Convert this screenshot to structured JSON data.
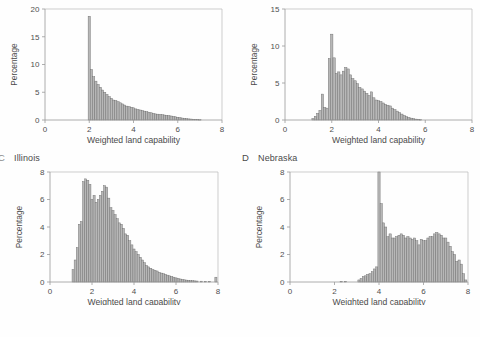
{
  "figure": {
    "caption_fragment": "",
    "shared_xlabel": "Weighted land capability",
    "shared_ylabel": "Percentage"
  },
  "panels": [
    {
      "letter": "",
      "name": "",
      "letter_clipped": true,
      "header_visible": false
    },
    {
      "letter": "",
      "name": "",
      "letter_clipped": true,
      "header_visible": false
    },
    {
      "letter": "C",
      "name": "Illinois",
      "letter_clipped": true,
      "header_visible": true
    },
    {
      "letter": "D",
      "name": "Nebraska",
      "letter_clipped": false,
      "header_visible": true
    }
  ],
  "chart_data": [
    {
      "type": "bar",
      "panel_letter": "",
      "panel_name": "",
      "title": "",
      "xlabel": "Weighted land capability",
      "ylabel": "Percentage",
      "xlim": [
        0,
        8
      ],
      "ylim": [
        0,
        20
      ],
      "xticks": [
        0,
        2,
        4,
        6,
        8
      ],
      "yticks": [
        0,
        5,
        10,
        15,
        20
      ],
      "grid": false,
      "bin_width": 0.1,
      "x": [
        2.0,
        2.1,
        2.2,
        2.3,
        2.4,
        2.5,
        2.6,
        2.7,
        2.8,
        2.9,
        3.0,
        3.1,
        3.2,
        3.3,
        3.4,
        3.5,
        3.6,
        3.7,
        3.8,
        3.9,
        4.0,
        4.1,
        4.2,
        4.3,
        4.4,
        4.5,
        4.6,
        4.7,
        4.8,
        4.9,
        5.0,
        5.1,
        5.2,
        5.3,
        5.4,
        5.5,
        5.6,
        5.7,
        5.8,
        5.9,
        6.0,
        6.1,
        6.2,
        6.3,
        6.4,
        6.5,
        6.6,
        6.7,
        6.8,
        6.9,
        7.0
      ],
      "values": [
        18.7,
        9.1,
        7.8,
        7.0,
        6.4,
        5.9,
        5.4,
        5.0,
        4.6,
        4.2,
        3.9,
        3.6,
        3.5,
        3.3,
        3.1,
        2.9,
        2.7,
        2.5,
        2.4,
        2.3,
        2.2,
        2.0,
        1.9,
        1.8,
        1.7,
        1.6,
        1.5,
        1.4,
        1.3,
        1.2,
        1.1,
        1.05,
        1.0,
        0.95,
        0.9,
        0.85,
        0.8,
        0.72,
        0.65,
        0.58,
        0.5,
        0.42,
        0.35,
        0.3,
        0.25,
        0.2,
        0.17,
        0.14,
        0.1,
        0.07,
        0.05
      ]
    },
    {
      "type": "bar",
      "panel_letter": "",
      "panel_name": "",
      "title": "",
      "xlabel": "Weighted land capability",
      "ylabel": "Percentage",
      "xlim": [
        0,
        8
      ],
      "ylim": [
        0,
        15
      ],
      "xticks": [
        0,
        2,
        4,
        6,
        8
      ],
      "yticks": [
        0,
        5,
        10,
        15
      ],
      "grid": false,
      "bin_width": 0.1,
      "x": [
        1.2,
        1.3,
        1.4,
        1.5,
        1.6,
        1.7,
        1.8,
        1.9,
        2.0,
        2.1,
        2.2,
        2.3,
        2.4,
        2.5,
        2.6,
        2.7,
        2.8,
        2.9,
        3.0,
        3.1,
        3.2,
        3.3,
        3.4,
        3.5,
        3.6,
        3.7,
        3.8,
        3.9,
        4.0,
        4.1,
        4.2,
        4.3,
        4.4,
        4.5,
        4.6,
        4.7,
        4.8,
        4.9,
        5.0,
        5.1,
        5.2,
        5.3,
        5.4,
        5.5,
        5.6,
        5.7,
        5.8
      ],
      "values": [
        0.2,
        0.5,
        0.9,
        1.3,
        3.5,
        1.7,
        1.6,
        8.3,
        11.6,
        8.4,
        6.3,
        6.5,
        6.1,
        6.6,
        7.1,
        6.9,
        6.1,
        5.6,
        5.3,
        4.9,
        4.4,
        4.2,
        3.9,
        3.6,
        3.3,
        3.8,
        3.0,
        2.7,
        2.6,
        2.5,
        2.3,
        2.1,
        2.0,
        1.9,
        1.6,
        1.4,
        1.2,
        1.0,
        0.8,
        0.6,
        0.45,
        0.35,
        0.25,
        0.18,
        0.12,
        0.07,
        0.04
      ]
    },
    {
      "type": "bar",
      "panel_letter": "C",
      "panel_name": "Illinois",
      "title": "",
      "xlabel": "Weighted land capability",
      "ylabel": "Percentage",
      "xlim": [
        0,
        8
      ],
      "ylim": [
        0,
        8
      ],
      "xticks": [
        0,
        2,
        4,
        6,
        8
      ],
      "yticks": [
        0,
        2,
        4,
        6,
        8
      ],
      "grid": false,
      "bin_width": 0.1,
      "x": [
        1.1,
        1.2,
        1.3,
        1.4,
        1.5,
        1.6,
        1.7,
        1.8,
        1.9,
        2.0,
        2.1,
        2.2,
        2.3,
        2.4,
        2.5,
        2.6,
        2.7,
        2.8,
        2.9,
        3.0,
        3.1,
        3.2,
        3.3,
        3.4,
        3.5,
        3.6,
        3.7,
        3.8,
        3.9,
        4.0,
        4.1,
        4.2,
        4.3,
        4.4,
        4.5,
        4.6,
        4.7,
        4.8,
        4.9,
        5.0,
        5.1,
        5.2,
        5.3,
        5.4,
        5.5,
        5.6,
        5.7,
        5.8,
        5.9,
        6.0,
        6.1,
        6.2,
        6.3,
        6.4,
        6.5,
        6.6,
        6.7,
        6.8,
        6.9,
        7.0,
        7.2,
        7.4,
        7.6,
        7.9
      ],
      "values": [
        0.9,
        1.6,
        2.5,
        4.2,
        4.4,
        7.3,
        7.5,
        7.4,
        7.1,
        6.0,
        6.3,
        5.8,
        6.0,
        6.3,
        6.6,
        7.0,
        6.9,
        6.1,
        5.4,
        5.2,
        4.9,
        4.6,
        4.3,
        4.2,
        3.9,
        3.5,
        3.4,
        3.0,
        2.7,
        2.4,
        2.2,
        2.0,
        1.8,
        1.6,
        1.4,
        1.2,
        1.1,
        1.0,
        0.9,
        0.85,
        0.8,
        0.7,
        0.65,
        0.6,
        0.55,
        0.5,
        0.45,
        0.4,
        0.35,
        0.3,
        0.26,
        0.22,
        0.19,
        0.16,
        0.14,
        0.12,
        0.1,
        0.09,
        0.08,
        0.07,
        0.06,
        0.05,
        0.05,
        0.35
      ]
    },
    {
      "type": "bar",
      "panel_letter": "D",
      "panel_name": "Nebraska",
      "title": "",
      "xlabel": "Weighted land capability",
      "ylabel": "Percentage",
      "xlim": [
        0,
        8
      ],
      "ylim": [
        0,
        8
      ],
      "xticks": [
        0,
        2,
        4,
        6,
        8
      ],
      "yticks": [
        0,
        2,
        4,
        6,
        8
      ],
      "grid": false,
      "bin_width": 0.1,
      "x": [
        2.3,
        2.5,
        3.1,
        3.2,
        3.3,
        3.4,
        3.5,
        3.6,
        3.7,
        3.8,
        3.9,
        4.0,
        4.1,
        4.2,
        4.3,
        4.4,
        4.5,
        4.6,
        4.7,
        4.8,
        4.9,
        5.0,
        5.1,
        5.2,
        5.3,
        5.4,
        5.5,
        5.6,
        5.7,
        5.8,
        5.9,
        6.0,
        6.1,
        6.2,
        6.3,
        6.4,
        6.5,
        6.6,
        6.7,
        6.8,
        6.9,
        7.0,
        7.1,
        7.2,
        7.3,
        7.4,
        7.5,
        7.6,
        7.7,
        7.8,
        7.9
      ],
      "values": [
        0.05,
        0.05,
        0.15,
        0.25,
        0.4,
        0.45,
        0.55,
        0.6,
        0.75,
        0.95,
        1.1,
        8.1,
        5.7,
        4.3,
        4.0,
        3.3,
        3.5,
        3.2,
        3.2,
        3.3,
        3.4,
        3.5,
        3.4,
        3.2,
        3.3,
        3.2,
        3.1,
        3.2,
        3.0,
        2.7,
        3.1,
        3.0,
        3.0,
        3.2,
        3.3,
        3.3,
        3.5,
        3.6,
        3.5,
        3.4,
        3.2,
        3.2,
        2.9,
        2.6,
        2.2,
        2.0,
        1.5,
        1.6,
        1.3,
        0.6,
        0.15
      ]
    }
  ]
}
